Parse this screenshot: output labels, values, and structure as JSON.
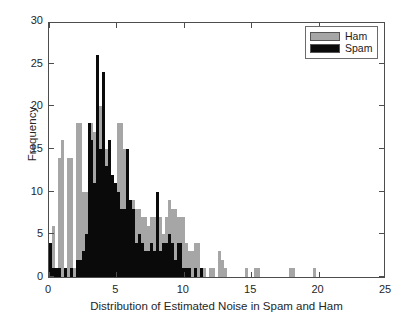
{
  "chart_data": {
    "type": "bar",
    "subtype": "histogram-overlay",
    "title": "",
    "xlabel": "Distribution of Estimated Noise in Spam and Ham",
    "ylabel": "Frequency",
    "xlim": [
      0,
      25
    ],
    "ylim": [
      0,
      30
    ],
    "xticks": [
      0,
      5,
      10,
      15,
      20,
      25
    ],
    "yticks": [
      0,
      5,
      10,
      15,
      20,
      25,
      30
    ],
    "grid": false,
    "legend_position": "top-right",
    "colors": {
      "ham": "#a6a6a6",
      "spam": "#0a0a0a",
      "axis": "#4d4d4d",
      "background": "#ffffff"
    },
    "bin_width": 0.22,
    "series": [
      {
        "name": "Ham",
        "color": "#a6a6a6",
        "x": [
          0.11,
          0.33,
          0.55,
          0.77,
          0.99,
          1.21,
          1.43,
          1.65,
          1.87,
          2.09,
          2.31,
          2.53,
          2.75,
          2.97,
          3.19,
          3.41,
          3.63,
          3.85,
          4.07,
          4.29,
          4.51,
          4.73,
          4.95,
          5.17,
          5.39,
          5.61,
          5.83,
          6.05,
          6.27,
          6.49,
          6.71,
          6.93,
          7.15,
          7.37,
          7.59,
          7.81,
          8.03,
          8.25,
          8.47,
          8.69,
          8.91,
          9.13,
          9.35,
          9.57,
          9.79,
          10.01,
          10.23,
          10.45,
          10.67,
          10.89,
          11.11,
          11.33,
          11.55,
          11.99,
          12.21,
          12.65,
          12.87,
          13.09,
          14.63,
          15.29,
          15.51,
          17.93,
          18.15,
          19.69
        ],
        "values": [
          1,
          6,
          1,
          14,
          16,
          1,
          14,
          14,
          1,
          18,
          18,
          10,
          10,
          17,
          18,
          17,
          20,
          20,
          17,
          15,
          15,
          9,
          9,
          18,
          18,
          15,
          13,
          9,
          9,
          8,
          8,
          7,
          7,
          6,
          7,
          7,
          7,
          7,
          5,
          7,
          9,
          8,
          8,
          7,
          7,
          7,
          4,
          3,
          3,
          4,
          4,
          1,
          1,
          1,
          1,
          3,
          2,
          1,
          1,
          1,
          1,
          1,
          1,
          1
        ]
      },
      {
        "name": "Spam",
        "color": "#0a0a0a",
        "x": [
          0.11,
          0.33,
          0.55,
          0.77,
          1.21,
          1.65,
          2.09,
          2.31,
          2.53,
          2.75,
          2.97,
          3.19,
          3.41,
          3.63,
          3.85,
          4.07,
          4.29,
          4.51,
          4.73,
          4.95,
          5.17,
          5.39,
          5.61,
          5.83,
          6.05,
          6.27,
          6.49,
          6.71,
          6.93,
          7.15,
          7.37,
          7.59,
          7.81,
          8.03,
          8.25,
          8.47,
          8.69,
          8.91,
          9.13,
          9.35,
          9.57,
          9.79,
          10.01,
          10.23,
          10.45,
          10.89,
          11.33
        ],
        "values": [
          4,
          1,
          1,
          1,
          1,
          1,
          2,
          2,
          3,
          5,
          18,
          16,
          11,
          26,
          15,
          24,
          13,
          16,
          12,
          11,
          10,
          8,
          8,
          15,
          9,
          8,
          4,
          5,
          4,
          3,
          3,
          4,
          3,
          10,
          3,
          4,
          4,
          5,
          4,
          2,
          4,
          4,
          1,
          1,
          1,
          1,
          1
        ]
      }
    ]
  },
  "legend": {
    "items": [
      {
        "label": "Ham",
        "color": "#a6a6a6"
      },
      {
        "label": "Spam",
        "color": "#0a0a0a"
      }
    ]
  },
  "axes": {
    "x_tick_labels": [
      "0",
      "5",
      "10",
      "15",
      "20",
      "25"
    ],
    "y_tick_labels": [
      "0",
      "5",
      "10",
      "15",
      "20",
      "25",
      "30"
    ]
  }
}
